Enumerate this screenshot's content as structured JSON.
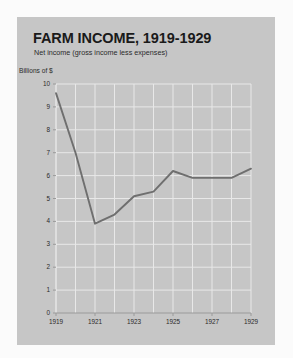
{
  "chart_data": {
    "type": "line",
    "title": "FARM INCOME, 1919-1929",
    "subtitle": "Net income (gross income less expenses)",
    "ylabel": "Billions of $",
    "xlabel": "",
    "x": [
      1919,
      1920,
      1921,
      1922,
      1923,
      1924,
      1925,
      1926,
      1927,
      1928,
      1929
    ],
    "values": [
      9.6,
      7.0,
      3.9,
      4.3,
      5.1,
      5.3,
      6.2,
      5.9,
      5.9,
      5.9,
      6.3
    ],
    "series": [
      {
        "name": "Net farm income",
        "values": [
          9.6,
          7.0,
          3.9,
          4.3,
          5.1,
          5.3,
          6.2,
          5.9,
          5.9,
          5.9,
          6.3
        ]
      }
    ],
    "ylim": [
      0,
      10
    ],
    "xlim": [
      1919,
      1929
    ],
    "y_ticks": [
      0,
      1,
      2,
      3,
      4,
      5,
      6,
      7,
      8,
      9,
      10
    ],
    "y_tick_labels": [
      "0",
      "1",
      "2",
      "3",
      "4",
      "5",
      "6",
      "7",
      "8",
      "9",
      "10"
    ],
    "x_ticks": [
      1919,
      1921,
      1923,
      1925,
      1927,
      1929
    ],
    "x_tick_labels": [
      "1919",
      "1921",
      "1923",
      "1925",
      "1927",
      "1929"
    ],
    "x_gridlines": [
      1919,
      1920,
      1921,
      1922,
      1923,
      1924,
      1925,
      1926,
      1927,
      1928,
      1929
    ],
    "grid": true,
    "legend": false,
    "legend_position": "none",
    "annotations": [],
    "colors": {
      "card_background": "#c6c6c6",
      "page_background": "#fbfbfb",
      "line": "#6f6f6f",
      "grid": "#e8e8e8",
      "axis": "#9a9a9a",
      "text": "#1a1a1a"
    }
  }
}
